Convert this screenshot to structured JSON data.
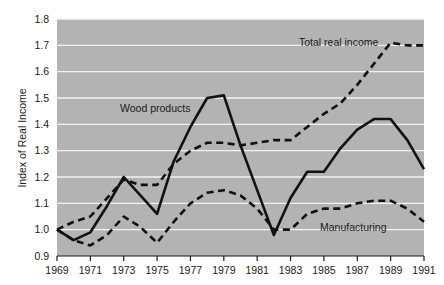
{
  "chart_data": {
    "type": "line",
    "title": "",
    "xlabel": "",
    "ylabel": "Index of Real Income",
    "xlim": [
      1969,
      1991
    ],
    "ylim": [
      0.9,
      1.8
    ],
    "yticks": [
      "0.9",
      "1.0",
      "1.1",
      "1.2",
      "1.3",
      "1.4",
      "1.5",
      "1.6",
      "1.7",
      "1.8"
    ],
    "xticks": [
      "1969",
      "1971",
      "1973",
      "1975",
      "1977",
      "1979",
      "1981",
      "1983",
      "1985",
      "1987",
      "1989",
      "1991"
    ],
    "grid": "horizontal",
    "legend_position": "inline-annotations",
    "plot_background": "#b3b3b3",
    "line_color": "#111111",
    "x": [
      1969,
      1970,
      1971,
      1972,
      1973,
      1974,
      1975,
      1976,
      1977,
      1978,
      1979,
      1980,
      1981,
      1982,
      1983,
      1984,
      1985,
      1986,
      1987,
      1988,
      1989,
      1990,
      1991
    ],
    "series": [
      {
        "name": "Total real income",
        "style": "dashed",
        "label": "Total real income",
        "values": [
          1.0,
          1.03,
          1.05,
          1.12,
          1.19,
          1.17,
          1.17,
          1.25,
          1.3,
          1.33,
          1.33,
          1.32,
          1.33,
          1.34,
          1.34,
          1.39,
          1.44,
          1.48,
          1.55,
          1.63,
          1.71,
          1.7,
          1.7
        ]
      },
      {
        "name": "Wood products",
        "style": "solid",
        "label": "Wood products",
        "values": [
          1.0,
          0.96,
          0.99,
          1.09,
          1.2,
          1.13,
          1.06,
          1.26,
          1.39,
          1.5,
          1.51,
          1.32,
          1.15,
          0.98,
          1.12,
          1.22,
          1.22,
          1.31,
          1.38,
          1.42,
          1.42,
          1.34,
          1.23
        ]
      },
      {
        "name": "Manufacturing",
        "style": "dashed",
        "label": "Manufacturing",
        "values": [
          1.0,
          0.96,
          0.94,
          0.98,
          1.05,
          1.01,
          0.95,
          1.03,
          1.1,
          1.14,
          1.15,
          1.13,
          1.08,
          1.0,
          1.0,
          1.06,
          1.08,
          1.08,
          1.1,
          1.11,
          1.11,
          1.08,
          1.03
        ]
      }
    ],
    "annotations": [
      {
        "text": "Wood products",
        "x_px": 120,
        "y_px": 112
      },
      {
        "text": "Total real income",
        "x_px": 299,
        "y_px": 46
      },
      {
        "text": "Manufacturing",
        "x_px": 320,
        "y_px": 231
      }
    ]
  }
}
